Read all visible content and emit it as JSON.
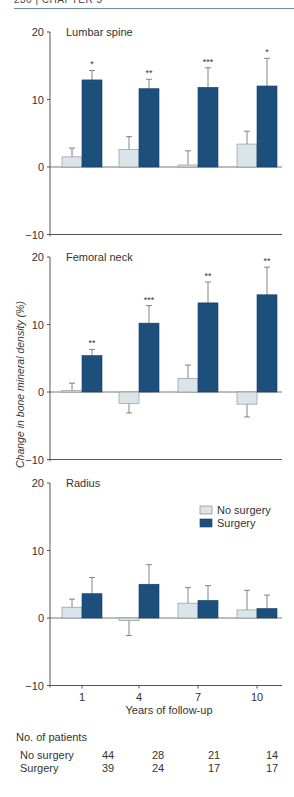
{
  "header": {
    "text": "236 | CHAPTER 5"
  },
  "chart_data": {
    "type": "bar",
    "title": "",
    "ylabel": "Change in bone mineral density (%)",
    "xlabel": "Years of follow-up",
    "categories": [
      "1",
      "4",
      "7",
      "10"
    ],
    "ylim": [
      -10,
      20
    ],
    "yticks": [
      -10,
      0,
      10,
      20
    ],
    "legend": {
      "position": "upper right of Radius panel",
      "entries": [
        "No surgery",
        "Surgery"
      ]
    },
    "colors": {
      "no_surgery": "#d9e5ea",
      "surgery": "#1c4f7c",
      "axis": "#555555"
    },
    "panels": [
      {
        "title": "Lumbar spine",
        "series": [
          {
            "name": "No surgery",
            "values": [
              1.5,
              2.6,
              0.3,
              3.4
            ],
            "error_upper": [
              2.8,
              4.5,
              2.4,
              5.3
            ]
          },
          {
            "name": "Surgery",
            "values": [
              12.9,
              11.6,
              11.8,
              12.0
            ],
            "error_upper": [
              14.3,
              13.0,
              14.7,
              16.1
            ]
          }
        ],
        "significance": [
          "*",
          "**",
          "***",
          "*"
        ]
      },
      {
        "title": "Femoral neck",
        "series": [
          {
            "name": "No surgery",
            "values": [
              0.2,
              -1.7,
              2.0,
              -1.8
            ],
            "error_upper": [
              1.3,
              -3.1,
              4.0,
              -3.7
            ]
          },
          {
            "name": "Surgery",
            "values": [
              5.4,
              10.2,
              13.2,
              14.4
            ],
            "error_upper": [
              6.3,
              12.8,
              16.3,
              18.5
            ]
          }
        ],
        "significance": [
          "**",
          "***",
          "**",
          "**"
        ]
      },
      {
        "title": "Radius",
        "series": [
          {
            "name": "No surgery",
            "values": [
              1.6,
              -0.4,
              2.2,
              1.2
            ],
            "error_upper": [
              2.8,
              -2.6,
              4.5,
              4.1
            ]
          },
          {
            "name": "Surgery",
            "values": [
              3.6,
              5.0,
              2.6,
              1.4
            ],
            "error_upper": [
              6.0,
              7.9,
              4.8,
              3.4
            ]
          }
        ],
        "significance": [
          "",
          "",
          "",
          ""
        ]
      }
    ],
    "patients_table": {
      "heading": "No. of patients",
      "rows": [
        {
          "label": "No surgery",
          "values": [
            44,
            28,
            21,
            14
          ]
        },
        {
          "label": "Surgery",
          "values": [
            39,
            24,
            17,
            17
          ]
        }
      ]
    }
  },
  "patients": {
    "heading": "No. of patients",
    "no_surgery_label": "No surgery",
    "surgery_label": "Surgery",
    "no_surgery": [
      "44",
      "28",
      "21",
      "14"
    ],
    "surgery": [
      "39",
      "24",
      "17",
      "17"
    ]
  }
}
